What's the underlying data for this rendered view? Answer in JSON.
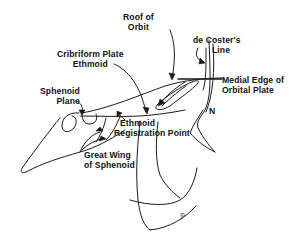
{
  "figure": {
    "labels": {
      "roof_of_orbit": [
        "Roof of",
        "Orbit"
      ],
      "de_costers_line": [
        "de Coster's",
        "Line"
      ],
      "cribriform_plate": [
        "Cribriform Plate",
        "Ethmoid"
      ],
      "medial_edge": [
        "Medial Edge of",
        "Orbital Plate"
      ],
      "sphenoid_plane": [
        "Sphenoid",
        "Plane"
      ],
      "nasion_marker": "N",
      "ethmoid_registration": [
        "Ethmoid",
        "Registration Point"
      ],
      "great_wing": [
        "Great Wing",
        "of Sphenoid"
      ]
    },
    "signature": "jb",
    "colors": {
      "line": "#1a1a1a",
      "text": "#111111",
      "background": "#ffffff"
    }
  }
}
